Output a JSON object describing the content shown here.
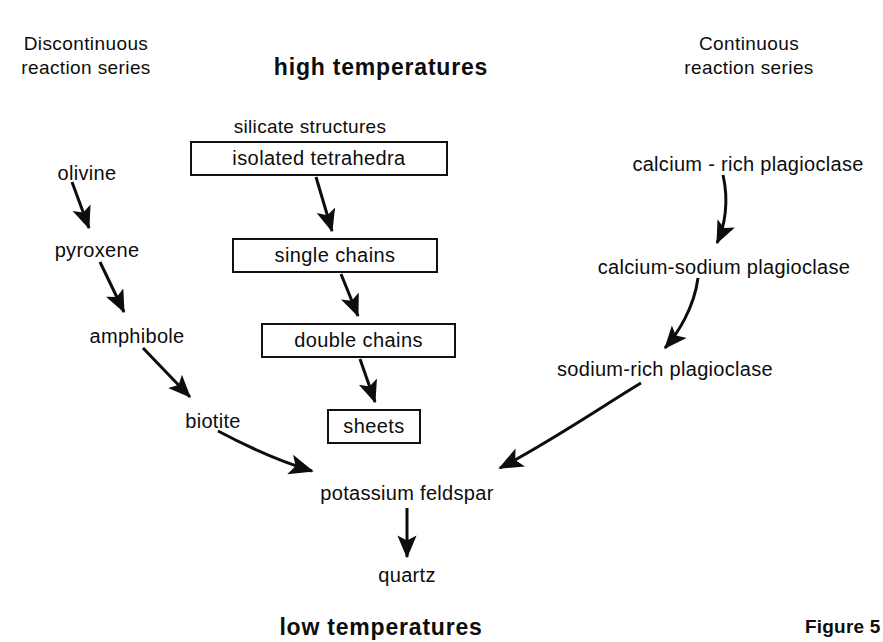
{
  "diagram": {
    "title_center_top": "high temperatures",
    "title_center_bottom": "low temperatures",
    "left_header_line1": "Discontinuous",
    "left_header_line2": "reaction series",
    "right_header_line1": "Continuous",
    "right_header_line2": "reaction series",
    "middle_header": "silicate structures",
    "figure_caption": "Figure 5"
  },
  "discontinuous_series": {
    "nodes": [
      {
        "label": "olivine"
      },
      {
        "label": "pyroxene"
      },
      {
        "label": "amphibole"
      },
      {
        "label": "biotite"
      }
    ]
  },
  "silicate_structures": {
    "boxes": [
      {
        "label": "isolated tetrahedra"
      },
      {
        "label": "single chains"
      },
      {
        "label": "double chains"
      },
      {
        "label": "sheets"
      }
    ]
  },
  "continuous_series": {
    "nodes": [
      {
        "label": "calcium - rich plagioclase"
      },
      {
        "label": "calcium-sodium plagioclase"
      },
      {
        "label": "sodium-rich plagioclase"
      }
    ]
  },
  "convergence": {
    "nodes": [
      {
        "label": "potassium feldspar"
      },
      {
        "label": "quartz"
      }
    ]
  },
  "colors": {
    "ink": "#0d0d0d",
    "background": "#ffffff",
    "box_border": "#111111"
  }
}
